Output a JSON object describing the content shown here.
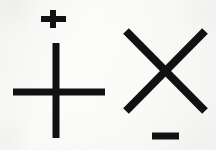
{
  "scene": {
    "title": "Mathematical sign symbols",
    "width": 216,
    "height": 150,
    "background_color": "#fbfbfa",
    "ink_color": "#111111"
  },
  "symbols": [
    {
      "id": "small-plus",
      "name": "plus-sign",
      "glyph": "+",
      "meaning": "plus",
      "position": "upper-left",
      "bbox": {
        "x": 41,
        "y": 10,
        "width": 25,
        "height": 18
      },
      "stroke_width": 6,
      "center": {
        "x": 53,
        "y": 19
      },
      "horizontal_bar": {
        "x1": 41,
        "y1": 19,
        "x2": 66,
        "y2": 19
      },
      "vertical_bar": {
        "x1": 53,
        "y1": 10,
        "x2": 53,
        "y2": 28
      }
    },
    {
      "id": "large-cross",
      "name": "cross-plus-sign",
      "glyph": "+",
      "meaning": "plus",
      "position": "left",
      "bbox": {
        "x": 13,
        "y": 43,
        "width": 92,
        "height": 95
      },
      "stroke_width": 7,
      "center": {
        "x": 56,
        "y": 92
      },
      "horizontal_bar": {
        "x1": 13,
        "y1": 92,
        "x2": 105,
        "y2": 92
      },
      "vertical_bar": {
        "x1": 56,
        "y1": 43,
        "x2": 56,
        "y2": 138
      }
    },
    {
      "id": "x-mark",
      "name": "multiplication-x-sign",
      "glyph": "×",
      "meaning": "times",
      "position": "right",
      "bbox": {
        "x": 126,
        "y": 31,
        "width": 79,
        "height": 80
      },
      "stroke_width": 8,
      "center": {
        "x": 165,
        "y": 71
      },
      "stroke_a": {
        "x1": 126,
        "y1": 31,
        "x2": 205,
        "y2": 111
      },
      "stroke_b": {
        "x1": 205,
        "y1": 31,
        "x2": 126,
        "y2": 111
      }
    },
    {
      "id": "minus",
      "name": "minus-sign",
      "glyph": "−",
      "meaning": "minus",
      "position": "lower-right",
      "bbox": {
        "x": 152,
        "y": 133,
        "width": 27,
        "height": 7
      },
      "stroke_width": 7,
      "center": {
        "x": 165,
        "y": 136
      },
      "horizontal_bar": {
        "x1": 152,
        "y1": 136,
        "x2": 179,
        "y2": 136
      }
    }
  ]
}
